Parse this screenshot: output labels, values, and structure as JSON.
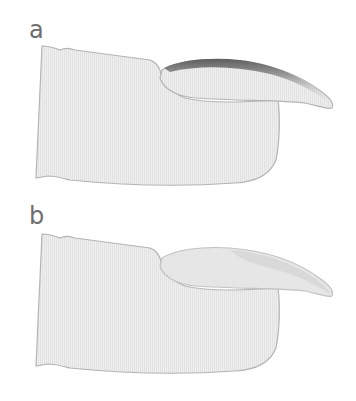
{
  "figure": {
    "panels": [
      {
        "label": "a",
        "description": "finger with curved nail, dark shading along upper nail edge"
      },
      {
        "label": "b",
        "description": "finger with curved nail, light uniform nail shading"
      }
    ]
  },
  "colors": {
    "fill": "#ececec",
    "stripe": "#e0e0e0",
    "outline": "#b4b4b4",
    "nail_dark_edge": "#6a6a6a",
    "nail_light_shade": "#d8d8d8",
    "label": "#6e6e6e"
  }
}
